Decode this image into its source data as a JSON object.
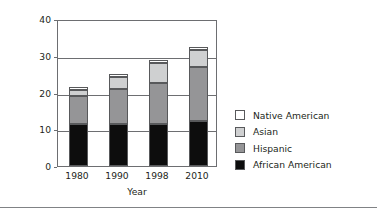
{
  "chart_data": {
    "type": "bar",
    "subtype": "stacked-bar",
    "title": "",
    "xlabel": "Year",
    "ylabel": "Percent of U.S. Population",
    "categories": [
      "1980",
      "1990",
      "1998",
      "2010"
    ],
    "ylim": [
      0,
      40
    ],
    "yticks": [
      0,
      10,
      20,
      30,
      40
    ],
    "grid": "horizontal",
    "legend_position": "right",
    "stack_order_bottom_to_top": [
      "African American",
      "Hispanic",
      "Asian",
      "Native American"
    ],
    "series": [
      {
        "name": "African American",
        "color": "#0d0d0d",
        "values": [
          11.3,
          11.3,
          11.3,
          12.2
        ]
      },
      {
        "name": "Hispanic",
        "color": "#959597",
        "values": [
          7.7,
          9.7,
          11.2,
          14.8
        ]
      },
      {
        "name": "Asian",
        "color": "#cfd0d1",
        "values": [
          1.7,
          3.2,
          5.6,
          4.5
        ]
      },
      {
        "name": "Native American",
        "color": "#ffffff",
        "values": [
          0.7,
          0.8,
          0.8,
          0.8
        ]
      }
    ],
    "totals": [
      21.4,
      25.0,
      28.9,
      32.3
    ],
    "annotations": []
  },
  "axes": {
    "y_title": "Percent of U.S. Population",
    "y_tick_labels": [
      "40",
      "30",
      "20",
      "10",
      "0"
    ],
    "x_title": "Year",
    "x_tick_labels": [
      "1980",
      "1990",
      "1998",
      "2010"
    ]
  },
  "legend": {
    "items": [
      {
        "label": "Native American",
        "color": "#ffffff"
      },
      {
        "label": "Asian",
        "color": "#cfd0d1"
      },
      {
        "label": "Hispanic",
        "color": "#959597"
      },
      {
        "label": "African American",
        "color": "#0d0d0d"
      }
    ]
  }
}
